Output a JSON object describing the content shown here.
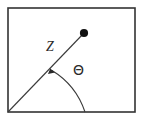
{
  "figure": {
    "kind": "vector-angle-diagram",
    "background_color": "#ffffff",
    "frame": {
      "name": "figure-border",
      "stroke_color": "#333333",
      "stroke_width": 1.6,
      "x": 8,
      "y": 8,
      "width": 127,
      "height": 104
    },
    "ray": {
      "name": "vector-ray",
      "stroke_color": "#3a3a3a",
      "stroke_width": 1.1,
      "x1": 8,
      "y1": 112,
      "x2": 84,
      "y2": 33
    },
    "endpoint_dot": {
      "name": "vector-endpoint",
      "fill_color": "#111111",
      "cx": 84,
      "cy": 33,
      "r": 4
    },
    "arc": {
      "name": "angle-arc",
      "stroke_color": "#3a3a3a",
      "stroke_width": 1.1,
      "center_x": 8,
      "center_y": 112,
      "radius": 77,
      "start_x": 85,
      "start_y": 112,
      "end_x": 51,
      "end_y": 70
    },
    "arrow_head": {
      "name": "arc-arrowhead",
      "fill_color": "#2b2b2b",
      "tip_x": 50,
      "tip_y": 68
    },
    "labels": {
      "vector_label": "Z",
      "angle_label": "Θ"
    }
  }
}
